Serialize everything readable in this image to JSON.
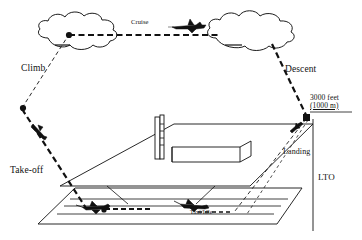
{
  "diagram": {
    "labels": {
      "cruise": "Cruise",
      "climb": "Climb",
      "descent": "Descent",
      "takeoff": "Take-off",
      "landing": "Landing",
      "lto": "LTO",
      "taxi_idle": "Taxi/Idle",
      "altitude_line1": "3000 feet",
      "altitude_line2": "(1000 m)"
    },
    "icons": {
      "cloud_left": "cloud-icon",
      "cloud_right": "cloud-icon",
      "aircraft_cruise": "airplane-icon",
      "aircraft_takeoff": "airplane-icon",
      "aircraft_ground_left": "airplane-icon",
      "aircraft_ground_right": "airplane-icon",
      "aircraft_landing": "airplane-icon",
      "terminal": "terminal-building-icon",
      "control_tower": "control-tower-icon",
      "runway": "runway-icon",
      "vertex_marker": "flight-phase-vertex-marker"
    },
    "colors": {
      "ink": "#111111",
      "background": "#ffffff",
      "line": "#000000"
    }
  }
}
